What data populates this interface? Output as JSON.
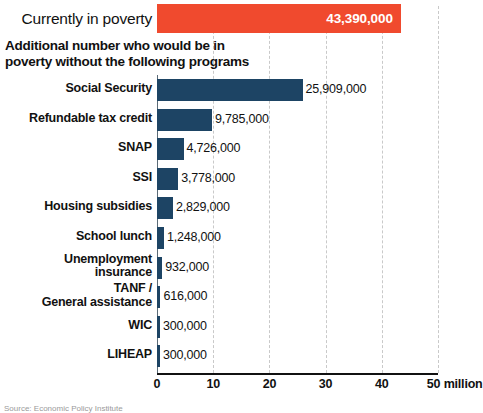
{
  "headline": {
    "label": "Currently in poverty",
    "value_label": "43,390,000",
    "value": 43390000,
    "color": "#f04a2e"
  },
  "subtitle": {
    "line1": "Additional number who would be in",
    "line2": "poverty without the following programs"
  },
  "axis": {
    "ticks": [
      "0",
      "10",
      "20",
      "30",
      "40",
      "50 million"
    ],
    "tick_values": [
      0,
      10,
      20,
      30,
      40,
      50
    ],
    "unit": "million",
    "max": 50,
    "min": 0
  },
  "source": {
    "text": "Source: Economic Policy Institute"
  },
  "colors": {
    "bar": "#1d4464",
    "highlight": "#f04a2e",
    "gridline": "#c9c9c9",
    "axis": "#111111"
  },
  "chart_data": {
    "type": "bar",
    "orientation": "horizontal",
    "title": "Currently in poverty",
    "subtitle": "Additional number who would be in poverty without the following programs",
    "xlabel": "50 million",
    "ylabel": "",
    "xlim": [
      0,
      50000000
    ],
    "grid": true,
    "legend": false,
    "categories": [
      "Social Security",
      "Refundable tax credit",
      "SNAP",
      "SSI",
      "Housing subsidies",
      "School lunch",
      "Unemployment insurance",
      "TANF / General assistance",
      "WIC",
      "LIHEAP"
    ],
    "values": [
      25909000,
      9785000,
      4726000,
      3778000,
      2829000,
      1248000,
      932000,
      616000,
      300000,
      300000
    ],
    "value_labels": [
      "25,909,000",
      "9,785,000",
      "4,726,000",
      "3,778,000",
      "2,829,000",
      "1,248,000",
      "932,000",
      "616,000",
      "300,000",
      "300,000"
    ],
    "highlight_bar": {
      "category": "Currently in poverty",
      "value": 43390000,
      "value_label": "43,390,000"
    },
    "tick_labels": [
      "0",
      "10",
      "20",
      "30",
      "40",
      "50 million"
    ],
    "annotations": []
  },
  "rows": [
    {
      "label_lines": [
        "Social Security"
      ],
      "value_label": "25,909,000",
      "value": 25909000
    },
    {
      "label_lines": [
        "Refundable tax credit"
      ],
      "value_label": "9,785,000",
      "value": 9785000
    },
    {
      "label_lines": [
        "SNAP"
      ],
      "value_label": "4,726,000",
      "value": 4726000
    },
    {
      "label_lines": [
        "SSI"
      ],
      "value_label": "3,778,000",
      "value": 3778000
    },
    {
      "label_lines": [
        "Housing subsidies"
      ],
      "value_label": "2,829,000",
      "value": 2829000
    },
    {
      "label_lines": [
        "School lunch"
      ],
      "value_label": "1,248,000",
      "value": 1248000
    },
    {
      "label_lines": [
        "Unemployment",
        "insurance"
      ],
      "value_label": "932,000",
      "value": 932000
    },
    {
      "label_lines": [
        "TANF /",
        "General assistance"
      ],
      "value_label": "616,000",
      "value": 616000
    },
    {
      "label_lines": [
        "WIC"
      ],
      "value_label": "300,000",
      "value": 300000
    },
    {
      "label_lines": [
        "LIHEAP"
      ],
      "value_label": "300,000",
      "value": 300000
    }
  ]
}
